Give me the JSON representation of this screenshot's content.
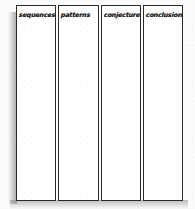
{
  "worksheet": {
    "title": "graphic organizer",
    "type": "four-column chart",
    "orientation": "portrait",
    "paper_color": "#fdfdfd",
    "ink_color": "#232323",
    "border_color": "#2a2a2a",
    "shadow_color": "#787878",
    "columns": [
      {
        "label": "sequences",
        "content": ""
      },
      {
        "label": "patterns",
        "content": ""
      },
      {
        "label": "conjectures",
        "content": ""
      },
      {
        "label": "conclusions",
        "content": ""
      }
    ]
  }
}
